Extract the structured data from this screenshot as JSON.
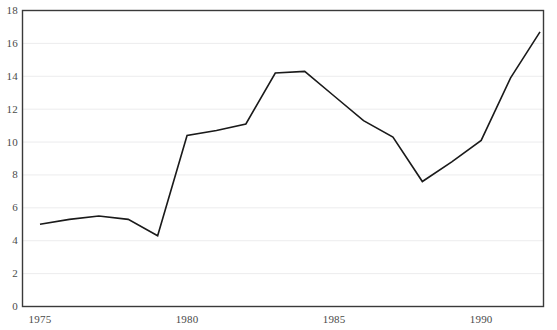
{
  "chart_data": {
    "type": "line",
    "title": "",
    "subtitle": "",
    "xlabel": "",
    "ylabel": "",
    "x": [
      1975,
      1976,
      1977,
      1978,
      1979,
      1980,
      1981,
      1982,
      1983,
      1984,
      1985,
      1986,
      1987,
      1988,
      1989,
      1990,
      1991,
      1992
    ],
    "values": [
      5.0,
      5.3,
      5.5,
      5.3,
      4.3,
      10.4,
      10.7,
      11.1,
      14.2,
      14.3,
      12.8,
      11.3,
      10.3,
      7.6,
      8.8,
      10.1,
      13.9,
      16.7
    ],
    "series": [
      {
        "name": "series-1",
        "values": [
          5.0,
          5.3,
          5.5,
          5.3,
          4.3,
          10.4,
          10.7,
          11.1,
          14.2,
          14.3,
          12.8,
          11.3,
          10.3,
          7.6,
          8.8,
          10.1,
          13.9,
          16.7
        ],
        "color": "#1a1a1a"
      }
    ],
    "xlim": [
      1975,
      1992
    ],
    "ylim": [
      0,
      18
    ],
    "ytick_values": [
      0,
      2,
      4,
      6,
      8,
      10,
      12,
      14,
      16,
      18
    ],
    "ytick_labels": [
      "0",
      "2",
      "4",
      "6",
      "8",
      "10",
      "12",
      "14",
      "16",
      "18"
    ],
    "xtick_values": [
      1975,
      1980,
      1985,
      1990
    ],
    "xtick_labels": [
      "1975",
      "1980",
      "1985",
      "1990"
    ],
    "grid": {
      "horizontal": true,
      "vertical": false,
      "color": "#ececed"
    },
    "legend": {
      "visible": false,
      "position": "none",
      "entries": []
    },
    "annotations": [],
    "frame": {
      "visible": true,
      "color": "#3a3a3a"
    },
    "background_color": "#ffffff",
    "line_color": "#1a1a1a",
    "line_width": 1.6
  }
}
